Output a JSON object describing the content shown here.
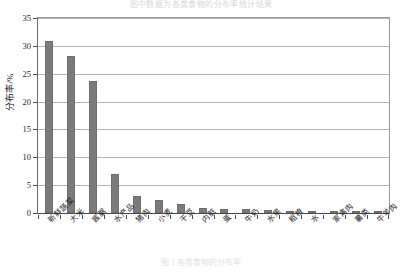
{
  "top_strip": {
    "clipped_text": "图中数据为各类食物的分布率统计结果"
  },
  "caption": {
    "text": "图 1  各类食物的分布率"
  },
  "chart_data": {
    "type": "bar",
    "title": "",
    "xlabel": "",
    "ylabel": "分布率/%",
    "ylim": [
      0,
      35
    ],
    "yticks": [
      0,
      5,
      10,
      15,
      20,
      25,
      30,
      35
    ],
    "grid": true,
    "legend": "none",
    "bar_color": "#7b7b7b",
    "categories": [
      "新鲜蔬菜",
      "大米",
      "酱腒",
      "水产品",
      "猪肉",
      "小麦",
      "干豆",
      "内脏",
      "蛋",
      "牛奶",
      "水果",
      "粗粮",
      "水",
      "家禽肉",
      "薯类",
      "牛羊肉"
    ],
    "values": [
      30.8,
      28.2,
      23.7,
      7.0,
      3.0,
      2.3,
      1.6,
      0.9,
      0.8,
      0.7,
      0.6,
      0.4,
      0.3,
      0.25,
      0.2,
      0.15
    ]
  }
}
